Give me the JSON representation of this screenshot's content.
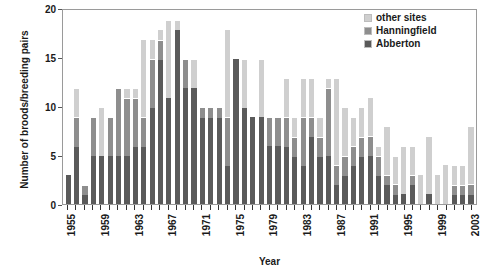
{
  "chart_data": {
    "type": "bar",
    "stacked": true,
    "title": "",
    "xlabel": "Year",
    "ylabel": "Number of broods/breeding pairs",
    "ylim": [
      0,
      20
    ],
    "yticks": [
      0,
      5,
      10,
      15,
      20
    ],
    "grid": false,
    "legend_position": "top-right",
    "legend": [
      "other sites",
      "Hanningfield",
      "Abberton"
    ],
    "colors": {
      "other sites": "#cfcfcf",
      "Hanningfield": "#8e8e8e",
      "Abberton": "#5a5a5a"
    },
    "categories": [
      "1955",
      "1956",
      "1957",
      "1958",
      "1959",
      "1960",
      "1961",
      "1962",
      "1963",
      "1964",
      "1965",
      "1966",
      "1967",
      "1968",
      "1969",
      "1970",
      "1971",
      "1972",
      "1973",
      "1974",
      "1975",
      "1976",
      "1977",
      "1978",
      "1979",
      "1980",
      "1981",
      "1982",
      "1983",
      "1984",
      "1985",
      "1986",
      "1987",
      "1988",
      "1989",
      "1990",
      "1991",
      "1992",
      "1993",
      "1994",
      "1995",
      "1996",
      "1997",
      "1998",
      "1999",
      "2000",
      "2001",
      "2002",
      "2003"
    ],
    "xtick_labels": [
      "1955",
      "",
      "",
      "",
      "1959",
      "",
      "",
      "",
      "1963",
      "",
      "",
      "",
      "1967",
      "",
      "",
      "",
      "1971",
      "",
      "",
      "",
      "1975",
      "",
      "",
      "",
      "1979",
      "",
      "",
      "",
      "1983",
      "",
      "",
      "",
      "1987",
      "",
      "",
      "",
      "1991",
      "",
      "",
      "",
      "1995",
      "",
      "",
      "",
      "1999",
      "",
      "",
      "",
      "2003"
    ],
    "series": [
      {
        "name": "Abberton",
        "values": [
          3,
          6,
          1,
          5,
          5,
          5,
          5,
          5,
          6,
          6,
          10,
          15,
          11,
          18,
          12,
          12,
          9,
          9,
          9,
          4,
          15,
          10,
          9,
          9,
          6,
          6,
          6,
          5,
          4,
          7,
          5,
          5,
          2,
          3,
          4,
          5,
          5,
          3,
          2,
          1,
          1,
          2,
          0,
          1,
          0,
          0,
          1,
          1,
          1
        ]
      },
      {
        "name": "Hanningfield",
        "values": [
          0,
          3,
          1,
          4,
          0,
          4,
          7,
          6,
          5,
          3,
          5,
          2,
          0,
          0,
          3,
          0,
          1,
          1,
          1,
          5,
          0,
          0,
          0,
          0,
          3,
          3,
          3,
          2,
          5,
          2,
          2,
          7,
          2,
          2,
          2,
          2,
          2,
          2,
          1,
          1,
          0,
          1,
          0,
          0,
          0,
          0,
          1,
          1,
          1
        ]
      },
      {
        "name": "other sites",
        "values": [
          0,
          3,
          0,
          0,
          5,
          0,
          0,
          1,
          1,
          8,
          2,
          1,
          8,
          1,
          0,
          3,
          0,
          0,
          0,
          9,
          0,
          5,
          0,
          6,
          0,
          0,
          4,
          2,
          4,
          4,
          2,
          1,
          9,
          5,
          3,
          3,
          4,
          1,
          5,
          3,
          5,
          3,
          3,
          6,
          3,
          4,
          2,
          2,
          6
        ]
      }
    ]
  }
}
